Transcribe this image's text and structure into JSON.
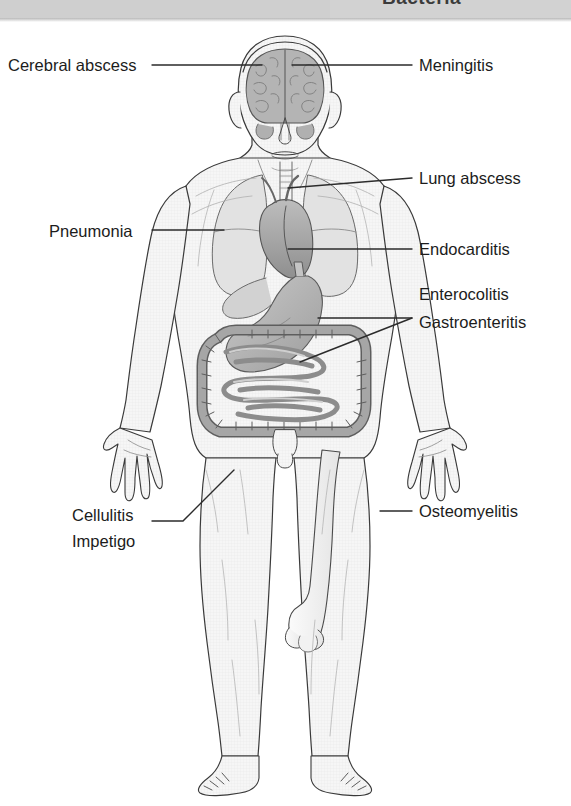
{
  "banner": {
    "title": "Bacteria"
  },
  "diagram": {
    "colors": {
      "skin_fill": "#f4f4f4",
      "outline": "#3a3a3a",
      "organ_mid": "#9a9a9a",
      "organ_dark": "#6f6f6f",
      "organ_light": "#d9d9d9",
      "leader_line": "#2b2b2b",
      "banner": "#d2d2d2",
      "text": "#1c1c1c"
    }
  },
  "labels": {
    "left": [
      {
        "id": "cerebral-abscess",
        "text": "Cerebral abscess",
        "x": 8,
        "y": 54,
        "target": "brain"
      },
      {
        "id": "pneumonia",
        "text": "Pneumonia",
        "x": 49,
        "y": 220,
        "target": "lung"
      },
      {
        "id": "cellulitis",
        "text": "Cellulitis",
        "x": 72,
        "y": 504,
        "target": "thigh-skin"
      },
      {
        "id": "impetigo",
        "text": "Impetigo",
        "x": 72,
        "y": 529,
        "target": "thigh-skin"
      }
    ],
    "right": [
      {
        "id": "meningitis",
        "text": "Meningitis",
        "x": 419,
        "y": 54,
        "target": "meninges"
      },
      {
        "id": "lung-abscess",
        "text": "Lung abscess",
        "x": 419,
        "y": 167,
        "target": "upper-chest"
      },
      {
        "id": "endocarditis",
        "text": "Endocarditis",
        "x": 419,
        "y": 238,
        "target": "heart"
      },
      {
        "id": "enterocolitis",
        "text": "Enterocolitis",
        "x": 419,
        "y": 283,
        "target": "intestines"
      },
      {
        "id": "gastroenteritis",
        "text": "Gastroenteritis",
        "x": 419,
        "y": 313,
        "target": "stomach"
      },
      {
        "id": "osteomyelitis",
        "text": "Osteomyelitis",
        "x": 419,
        "y": 500,
        "target": "femur"
      }
    ]
  },
  "leader_lines": [
    {
      "id": "leader-cerebral-abscess",
      "points": "152,65 255,65"
    },
    {
      "id": "leader-meningitis",
      "points": "412,65 290,65"
    },
    {
      "id": "leader-lung-abscess",
      "points": "412,178 288,188"
    },
    {
      "id": "leader-pneumonia",
      "points": "152,230 222,230"
    },
    {
      "id": "leader-endocarditis",
      "points": "412,249 288,249"
    },
    {
      "id": "leader-enterocolitis",
      "points": "412,318 318,318"
    },
    {
      "id": "leader-gastroenteritis",
      "points": "412,318 300,360"
    },
    {
      "id": "leader-cellulitis",
      "points": "152,521 182,521 233,470"
    },
    {
      "id": "leader-osteomyelitis",
      "points": "412,511 380,511"
    }
  ],
  "anatomy_parts": [
    {
      "id": "brain",
      "name": "brain"
    },
    {
      "id": "lungs",
      "name": "lungs"
    },
    {
      "id": "heart",
      "name": "heart"
    },
    {
      "id": "stomach",
      "name": "stomach"
    },
    {
      "id": "large-bowel",
      "name": "large-intestine"
    },
    {
      "id": "small-bowel",
      "name": "small-intestine"
    },
    {
      "id": "femur",
      "name": "femur-bone"
    }
  ]
}
